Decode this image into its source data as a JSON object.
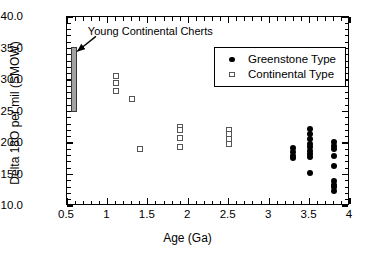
{
  "chart_data": {
    "type": "scatter",
    "title": "",
    "xlabel": "Age (Ga)",
    "ylabel": "Delta 18O per mil (SMOW)",
    "xlim": [
      0.5,
      4.0
    ],
    "ylim": [
      10.0,
      40.0
    ],
    "xticks": [
      0.5,
      1,
      1.5,
      2,
      2.5,
      3,
      3.5,
      4
    ],
    "xticklabels": [
      "0.5",
      "1",
      "1.5",
      "2",
      "2.5",
      "3",
      "3.5",
      "4"
    ],
    "xtick_minor_step": 0.1,
    "yticks": [
      10.0,
      15.0,
      20.0,
      25.0,
      30.0,
      35.0,
      40.0
    ],
    "yticklabels": [
      "10.0",
      "15.0",
      "20.0",
      "25.0",
      "30.0",
      "35.0",
      "40.0"
    ],
    "ytick_minor_step": 1.0,
    "grid": false,
    "legend_position": "upper right",
    "series": [
      {
        "name": "Greenstone Type",
        "marker": "filled-circle",
        "color": "#000000",
        "points": [
          [
            3.3,
            19.2
          ],
          [
            3.3,
            18.6
          ],
          [
            3.3,
            17.9
          ],
          [
            3.3,
            17.6
          ],
          [
            3.5,
            22.2
          ],
          [
            3.5,
            21.4
          ],
          [
            3.5,
            20.6
          ],
          [
            3.5,
            19.8
          ],
          [
            3.5,
            19.3
          ],
          [
            3.5,
            18.8
          ],
          [
            3.5,
            18.2
          ],
          [
            3.5,
            17.8
          ],
          [
            3.5,
            15.3
          ],
          [
            3.8,
            20.1
          ],
          [
            3.8,
            19.5
          ],
          [
            3.8,
            19.0
          ],
          [
            3.8,
            17.9
          ],
          [
            3.8,
            16.3
          ],
          [
            3.8,
            13.9
          ],
          [
            3.8,
            13.4
          ],
          [
            3.8,
            13.0
          ],
          [
            3.8,
            12.4
          ]
        ]
      },
      {
        "name": "Continental Type",
        "marker": "open-square",
        "color": "#555555",
        "points": [
          [
            1.1,
            30.7
          ],
          [
            1.1,
            29.5
          ],
          [
            1.1,
            28.2
          ],
          [
            1.3,
            27.0
          ],
          [
            1.4,
            19.1
          ],
          [
            1.9,
            22.6
          ],
          [
            1.9,
            22.0
          ],
          [
            1.9,
            20.8
          ],
          [
            1.9,
            19.3
          ],
          [
            2.5,
            22.0
          ],
          [
            2.5,
            21.4
          ],
          [
            2.5,
            20.7
          ],
          [
            2.5,
            19.9
          ]
        ]
      }
    ],
    "bands": [
      {
        "name": "Young Continental Cherts",
        "x_range": [
          0.545,
          0.625
        ],
        "y_range": [
          24.9,
          35.3
        ],
        "fill": "#a3a3a3",
        "edge": "#3a3a3a"
      }
    ],
    "annotations": [
      {
        "text": "Young Continental Cherts",
        "text_x": 0.77,
        "text_y": 37.4,
        "arrow_to_x": 0.64,
        "arrow_to_y": 34.4
      }
    ]
  },
  "legend": {
    "entries": [
      {
        "label": "Greenstone Type",
        "marker": "filled-circle"
      },
      {
        "label": "Continental Type",
        "marker": "open-square"
      }
    ]
  }
}
